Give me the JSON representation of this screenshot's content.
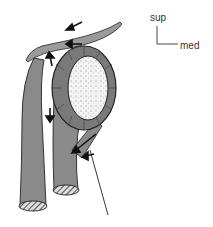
{
  "figure": {
    "type": "anatomical illustration",
    "orientation": {
      "superior_label": "sup",
      "medial_label": "med"
    },
    "colors": {
      "structure_fill": "#8a8a8a",
      "outline": "#222222",
      "glenoid_fill": "#f2f2f2",
      "background": "#ffffff"
    },
    "arrows": 6
  }
}
